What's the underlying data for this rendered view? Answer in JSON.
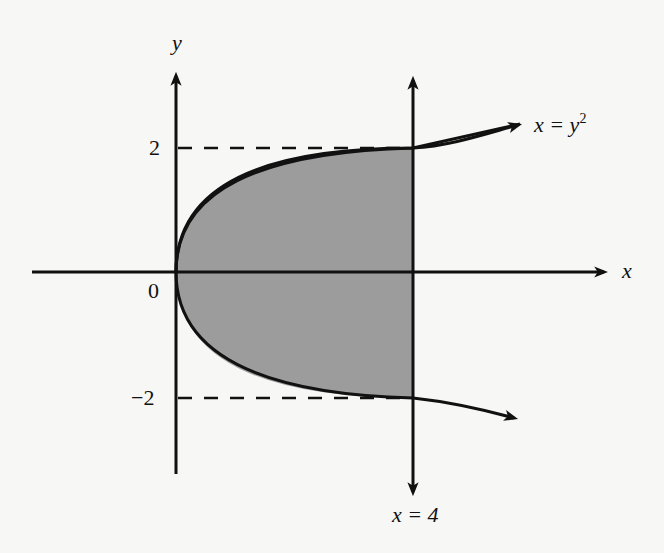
{
  "figure": {
    "axes": {
      "x_label": "x",
      "y_label": "y",
      "origin_label": "0"
    },
    "ticks": {
      "y_pos": "2",
      "y_neg": "−2"
    },
    "curve_label": {
      "lhs": "x = y",
      "exp": "2"
    },
    "line_label": "x = 4",
    "colors": {
      "shade": "#9c9c9c",
      "ink": "#111111",
      "background": "#f7f7f5"
    }
  }
}
